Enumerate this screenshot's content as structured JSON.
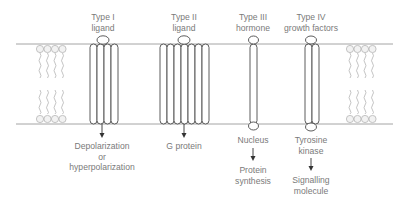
{
  "diagram": {
    "colors": {
      "line": "#4a4a4a",
      "membrane": "#9a9a9a",
      "lipid": "#b5b5b5",
      "text": "#7a7a7a"
    },
    "receptors": [
      {
        "id": "type1",
        "top_label": [
          "Type I",
          "ligand"
        ],
        "bottom_label": [
          "Depolarization",
          "or",
          "hyperpolarization"
        ],
        "secondary_label": []
      },
      {
        "id": "type2",
        "top_label": [
          "Type II",
          "ligand"
        ],
        "bottom_label": [
          "G protein"
        ],
        "secondary_label": []
      },
      {
        "id": "type3",
        "top_label": [
          "Type III",
          "hormone"
        ],
        "bottom_label": [
          "Nucleus"
        ],
        "secondary_label": [
          "Protein",
          "synthesis"
        ]
      },
      {
        "id": "type4",
        "top_label": [
          "Type IV",
          "growth factors"
        ],
        "bottom_label": [
          "Tyrosine",
          "kinase"
        ],
        "secondary_label": [
          "Signalling",
          "molecule"
        ]
      }
    ]
  }
}
